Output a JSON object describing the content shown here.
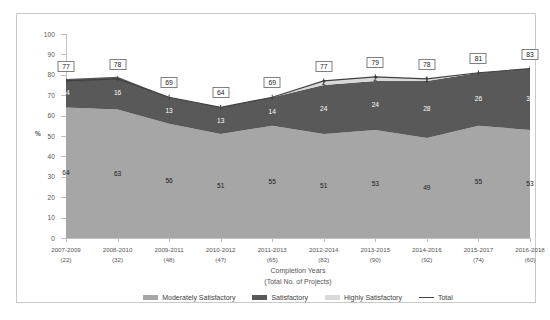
{
  "chart_data": {
    "type": "area",
    "stacked": true,
    "title": "",
    "xlabel": "Completion Years",
    "xlabel_sub": "(Total No. of Projects)",
    "ylabel": "%",
    "ylim": [
      0,
      100
    ],
    "ytick_step": 10,
    "yticks": [
      100,
      90,
      80,
      70,
      60,
      50,
      40,
      30,
      20,
      10,
      0
    ],
    "grid": false,
    "legend_position": "bottom",
    "categories": [
      "2007-2009",
      "2008-2010",
      "2009-2011",
      "2010-2012",
      "2011-2013",
      "2012-2014",
      "2013-2015",
      "2014-2016",
      "2015-2017",
      "2016-2018"
    ],
    "category_sublabels": [
      "(22)",
      "(32)",
      "(48)",
      "(47)",
      "(65)",
      "(82)",
      "(90)",
      "(92)",
      "(74)",
      "(60)"
    ],
    "series": [
      {
        "name": "Moderately Satisfactory",
        "color": "#a6a6a6",
        "values": [
          64,
          63,
          56,
          51,
          55,
          51,
          53,
          49,
          55,
          53
        ]
      },
      {
        "name": "Satisfactory",
        "color": "#595959",
        "values": [
          14,
          16,
          13,
          13,
          14,
          24,
          24,
          28,
          26,
          30
        ]
      },
      {
        "name": "Highly Satisfactory",
        "color": "#d9d9d9",
        "values": [
          0,
          0,
          0,
          0,
          0,
          2,
          2,
          1,
          0,
          0
        ]
      }
    ],
    "total_line": {
      "name": "Total",
      "color": "#404040",
      "values": [
        77,
        78,
        69,
        64,
        69,
        77,
        79,
        78,
        81,
        83
      ]
    }
  },
  "legend": {
    "items": [
      {
        "label": "Moderately Satisfactory",
        "color": "#a6a6a6",
        "kind": "swatch"
      },
      {
        "label": "Satisfactory",
        "color": "#595959",
        "kind": "swatch"
      },
      {
        "label": "Highly Satisfactory",
        "color": "#d9d9d9",
        "kind": "swatch"
      },
      {
        "label": "Total",
        "color": "#404040",
        "kind": "line"
      }
    ]
  },
  "colors": {
    "moderately_satisfactory": "#a6a6a6",
    "satisfactory": "#595959",
    "highly_satisfactory": "#d9d9d9",
    "total_line": "#404040",
    "frame": "#c9c9c9",
    "axis": "#bfbfbf",
    "text": "#555555"
  }
}
